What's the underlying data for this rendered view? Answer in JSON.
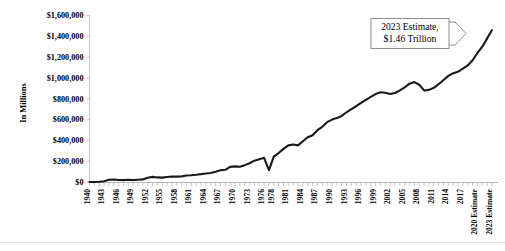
{
  "chart_data": {
    "type": "line",
    "title": "",
    "xlabel": "",
    "ylabel": "In Millions",
    "ylim": [
      0,
      1600000
    ],
    "ytick_labels": [
      "$0",
      "$200,000",
      "$400,000",
      "$600,000",
      "$800,000",
      "$1,000,000",
      "$1,200,000",
      "$1,400,000",
      "$1,600,000"
    ],
    "ytick_values": [
      0,
      200000,
      400000,
      600000,
      800000,
      1000000,
      1200000,
      1400000,
      1600000
    ],
    "grid": false,
    "legend": "none",
    "xtick_labels": [
      "1940",
      "1943",
      "1946",
      "1949",
      "1952",
      "1955",
      "1958",
      "1961",
      "1964",
      "1967",
      "1970",
      "1973",
      "1976",
      "1978",
      "1981",
      "1984",
      "1987",
      "1990",
      "1993",
      "1996",
      "1999",
      "2002",
      "2005",
      "2008",
      "2011",
      "2014",
      "2017",
      "2020 Estimate",
      "2023 Estimate"
    ],
    "x": [
      "1940",
      "1941",
      "1942",
      "1943",
      "1944",
      "1945",
      "1946",
      "1947",
      "1948",
      "1949",
      "1950",
      "1951",
      "1952",
      "1953",
      "1954",
      "1955",
      "1956",
      "1957",
      "1958",
      "1959",
      "1960",
      "1961",
      "1962",
      "1963",
      "1964",
      "1965",
      "1966",
      "1967",
      "1968",
      "1969",
      "1970",
      "1971",
      "1972",
      "1973",
      "1974",
      "1975",
      "1976",
      "TQ",
      "1978",
      "1979",
      "1980",
      "1981",
      "1982",
      "1983",
      "1984",
      "1985",
      "1986",
      "1987",
      "1988",
      "1989",
      "1990",
      "1991",
      "1992",
      "1993",
      "1994",
      "1995",
      "1996",
      "1997",
      "1998",
      "1999",
      "2000",
      "2001",
      "2002",
      "2003",
      "2004",
      "2005",
      "2006",
      "2007",
      "2008",
      "2009",
      "2010",
      "2011",
      "2012",
      "2013",
      "2014",
      "2015",
      "2016",
      "2017",
      "2018",
      "2019",
      "2020 Estimate",
      "2021 Estimate",
      "2022 Estimate",
      "2023 Estimate"
    ],
    "values": [
      9468,
      8711,
      14634,
      24001,
      43742,
      45159,
      39296,
      38514,
      41560,
      38417,
      42562,
      45514,
      67686,
      76100,
      70900,
      68400,
      74600,
      79900,
      79600,
      81000,
      92500,
      94400,
      99700,
      106600,
      112600,
      116800,
      130800,
      148800,
      153000,
      187800,
      192800,
      187100,
      207300,
      230800,
      263200,
      279100,
      298100,
      81200,
      355600,
      399600,
      517100,
      599300,
      617800,
      600600,
      666400,
      734000,
      769100,
      854100,
      909200,
      991100,
      1031900,
      1054900,
      1091200,
      1154300,
      1258600,
      1351800,
      1453100,
      1579200,
      1721700,
      1827500,
      2025200,
      1991100,
      1853100,
      1782300,
      1880100,
      2153600,
      2406900,
      2568000,
      2524000,
      2105000,
      2162700,
      2303500,
      2450000,
      2775100,
      3021500,
      3249900,
      3268000,
      3316200,
      3330000,
      3462000,
      1050000,
      1180000,
      1320000,
      1460000
    ],
    "y_plot": [
      0,
      0,
      2000,
      7000,
      22000,
      24000,
      19000,
      18000,
      21000,
      18000,
      22000,
      25000,
      41000,
      49000,
      44000,
      42000,
      48000,
      53000,
      52000,
      54000,
      63000,
      65000,
      70000,
      76000,
      82000,
      86000,
      98000,
      113000,
      117000,
      145000,
      150000,
      146000,
      162000,
      180000,
      205000,
      218000,
      232000,
      115000,
      244000,
      278000,
      318000,
      352000,
      360000,
      352000,
      392000,
      430000,
      450000,
      498000,
      530000,
      575000,
      600000,
      614000,
      635000,
      670000,
      700000,
      728000,
      760000,
      790000,
      818000,
      845000,
      862000,
      858000,
      846000,
      855000,
      880000,
      910000,
      945000,
      960000,
      935000,
      880000,
      885000,
      905000,
      940000,
      980000,
      1020000,
      1045000,
      1060000,
      1090000,
      1120000,
      1170000,
      1240000,
      1300000,
      1380000,
      1460000
    ],
    "annotations": [
      {
        "name": "estimate-callout",
        "line1": "2023 Estimate,",
        "line2": "$1.46 Trillion",
        "target_year": "2023 Estimate",
        "target_value": 1460000
      }
    ],
    "line_color": "#1a1a1a",
    "axis_color": "#c8c8c8",
    "background": "#ffffff"
  }
}
